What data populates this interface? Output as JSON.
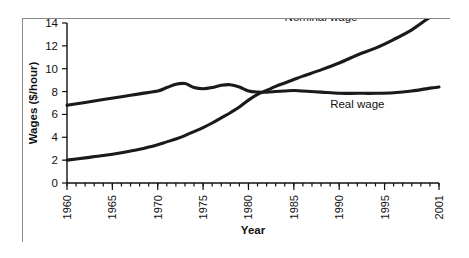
{
  "chart_data": {
    "type": "line",
    "title": "",
    "xlabel": "Year",
    "ylabel": "Wages ($/hour)",
    "xlim": [
      1960,
      2001
    ],
    "ylim": [
      0,
      14
    ],
    "grid": false,
    "legend_position": "inline-annotations",
    "x_tick_labels": [
      "1960",
      "1965",
      "1970",
      "1975",
      "1980",
      "1985",
      "1990",
      "1995",
      "2001"
    ],
    "x_tick_values": [
      1960,
      1965,
      1970,
      1975,
      1980,
      1985,
      1990,
      1995,
      2001
    ],
    "x_minor_ticks": [
      1960,
      1961,
      1962,
      1963,
      1964,
      1965,
      1966,
      1967,
      1968,
      1969,
      1970,
      1971,
      1972,
      1973,
      1974,
      1975,
      1976,
      1977,
      1978,
      1979,
      1980,
      1981,
      1982,
      1983,
      1984,
      1985,
      1986,
      1987,
      1988,
      1989,
      1990,
      1991,
      1992,
      1993,
      1994,
      1995,
      1996,
      1997,
      1998,
      1999,
      2000,
      2001
    ],
    "y_tick_labels": [
      "0",
      "2",
      "4",
      "6",
      "8",
      "10",
      "12",
      "14"
    ],
    "y_tick_values": [
      0,
      2,
      4,
      6,
      8,
      10,
      12,
      14
    ],
    "line_color": "#1a1a1a",
    "frame_color": "#8a8a8a",
    "background_color": "#ffffff",
    "x": [
      1960,
      1962,
      1964,
      1966,
      1968,
      1970,
      1971,
      1972,
      1973,
      1974,
      1975,
      1976,
      1977,
      1978,
      1979,
      1980,
      1981,
      1982,
      1983,
      1984,
      1985,
      1986,
      1988,
      1990,
      1992,
      1994,
      1996,
      1998,
      2000,
      2001
    ],
    "series": [
      {
        "name": "Nominal wage",
        "label": "Nominal wage",
        "label_x": 1988,
        "label_y": 14.2,
        "values": [
          2.0,
          2.2,
          2.4,
          2.65,
          2.95,
          3.35,
          3.6,
          3.85,
          4.15,
          4.5,
          4.85,
          5.25,
          5.7,
          6.15,
          6.65,
          7.25,
          7.75,
          8.1,
          8.45,
          8.75,
          9.05,
          9.35,
          9.9,
          10.5,
          11.2,
          11.8,
          12.55,
          13.4,
          14.5,
          14.8
        ]
      },
      {
        "name": "Real wage",
        "label": "Real wage",
        "label_x": 1992,
        "label_y": 6.6,
        "values": [
          6.8,
          7.05,
          7.3,
          7.55,
          7.8,
          8.05,
          8.35,
          8.65,
          8.7,
          8.35,
          8.25,
          8.35,
          8.55,
          8.6,
          8.4,
          8.05,
          7.95,
          7.95,
          8.0,
          8.05,
          8.1,
          8.05,
          7.95,
          7.85,
          7.85,
          7.85,
          7.9,
          8.05,
          8.3,
          8.4
        ]
      }
    ]
  }
}
